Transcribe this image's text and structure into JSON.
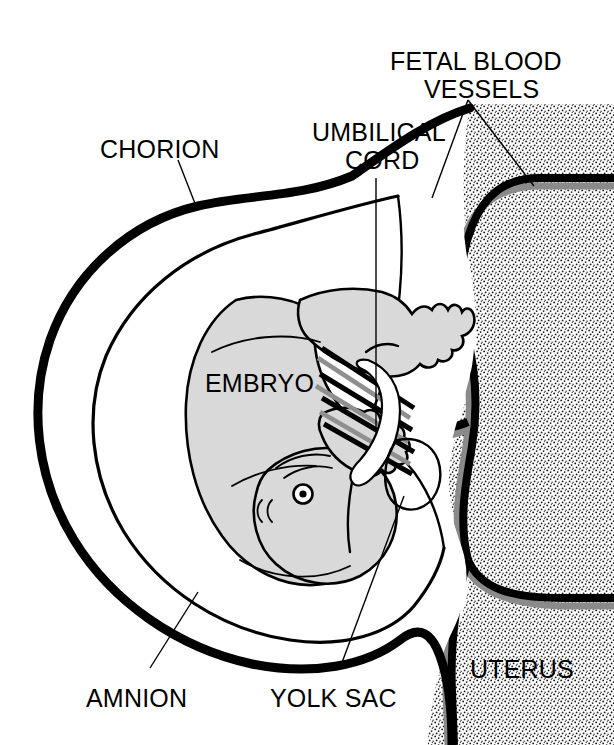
{
  "figure": {
    "domain": "anatomical-diagram",
    "background_color": "#ffffff",
    "ink_color": "#000000",
    "embryo_fill_color": "#d9d9d9",
    "vessel_shadow_color": "#8a8a8a",
    "uterus_texture": "stipple"
  },
  "labels": {
    "chorion": "CHORION",
    "umbilical_cord_line1": "UMBILICAL",
    "umbilical_cord_line2": "CORD",
    "fetal_blood_vessels_line1": "FETAL BLOOD",
    "fetal_blood_vessels_line2": "VESSELS",
    "embryo": "EMBRYO",
    "amnion": "AMNION",
    "yolk_sac": "YOLK SAC",
    "uterus": "UTERUS"
  },
  "structures": [
    {
      "name": "chorion",
      "label": "CHORION",
      "description": "Outermost thick membrane enclosing the conceptus"
    },
    {
      "name": "amnion",
      "label": "AMNION",
      "description": "Inner thin membrane surrounding the embryo"
    },
    {
      "name": "embryo",
      "label": "EMBRYO",
      "description": "Developing embryo with head, eye and limb buds"
    },
    {
      "name": "yolk-sac",
      "label": "YOLK SAC",
      "description": "Small sac attached near the embryo"
    },
    {
      "name": "umbilical-cord",
      "label": "UMBILICAL CORD",
      "description": "Stalk connecting embryo to the uterine wall"
    },
    {
      "name": "fetal-blood-vessels",
      "label": "FETAL BLOOD VESSELS",
      "description": "Paired vessels branching through the uterine wall"
    },
    {
      "name": "uterus",
      "label": "UTERUS",
      "description": "Stippled uterine wall tissue on the right"
    }
  ]
}
